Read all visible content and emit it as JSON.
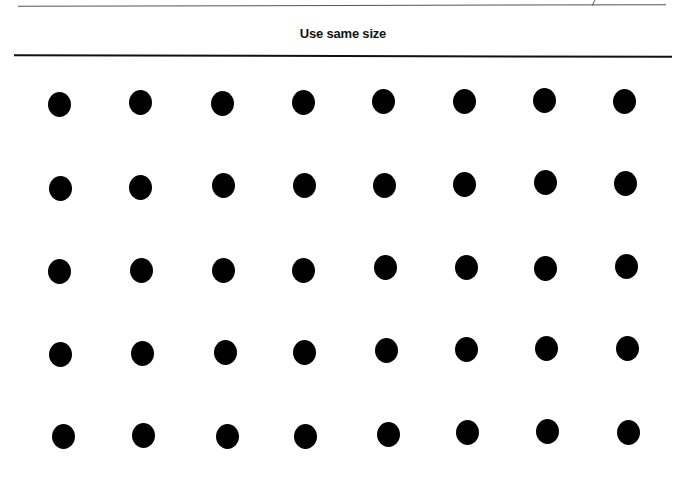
{
  "page": {
    "title": "Use same size"
  },
  "dot_grid": {
    "rows": 5,
    "columns": 8,
    "color": "#000000",
    "dots": [
      [
        [
          59,
          104
        ],
        [
          140,
          102
        ],
        [
          222,
          103
        ],
        [
          303,
          102
        ],
        [
          383,
          101
        ],
        [
          464,
          101
        ],
        [
          544,
          100
        ],
        [
          624,
          101
        ]
      ],
      [
        [
          60,
          188
        ],
        [
          140,
          187
        ],
        [
          223,
          185
        ],
        [
          304,
          185
        ],
        [
          384,
          185
        ],
        [
          464,
          184
        ],
        [
          545,
          182
        ],
        [
          625,
          183
        ]
      ],
      [
        [
          59,
          271
        ],
        [
          141,
          270
        ],
        [
          223,
          270
        ],
        [
          303,
          270
        ],
        [
          385,
          267
        ],
        [
          466,
          267
        ],
        [
          545,
          268
        ],
        [
          626,
          266
        ]
      ],
      [
        [
          60,
          354
        ],
        [
          142,
          353
        ],
        [
          225,
          352
        ],
        [
          304,
          352
        ],
        [
          386,
          350
        ],
        [
          466,
          349
        ],
        [
          546,
          348
        ],
        [
          627,
          348
        ]
      ],
      [
        [
          63,
          436
        ],
        [
          143,
          435
        ],
        [
          227,
          436
        ],
        [
          305,
          436
        ],
        [
          388,
          434
        ],
        [
          467,
          432
        ],
        [
          547,
          431
        ],
        [
          628,
          432
        ]
      ]
    ]
  }
}
